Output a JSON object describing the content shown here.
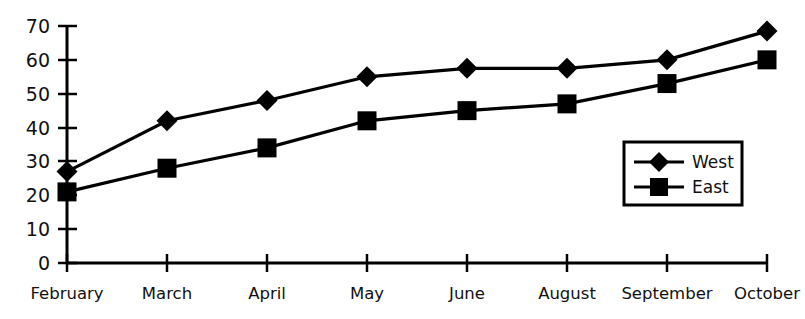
{
  "chart_data": {
    "type": "line",
    "title": "",
    "subtitle": "",
    "xlabel": "",
    "ylabel": "",
    "categories": [
      "February",
      "March",
      "April",
      "May",
      "June",
      "August",
      "September",
      "October"
    ],
    "series": [
      {
        "name": "West",
        "marker": "diamond",
        "color": "#000000",
        "values": [
          27,
          42,
          48,
          55,
          57.5,
          57.5,
          60,
          68.5
        ]
      },
      {
        "name": "East",
        "marker": "square",
        "color": "#000000",
        "values": [
          21,
          28,
          34,
          42,
          45,
          47,
          53,
          60
        ]
      }
    ],
    "ylim": [
      0,
      70
    ],
    "yticks": [
      0,
      10,
      20,
      30,
      40,
      50,
      60,
      70
    ],
    "ytick_labels": [
      "0",
      "10",
      "20",
      "30",
      "40",
      "50",
      "60",
      "70"
    ],
    "grid": false,
    "legend_position": "inside-right",
    "legend_entries": [
      {
        "label": "West",
        "marker": "diamond"
      },
      {
        "label": "East",
        "marker": "square"
      }
    ]
  },
  "colors": {
    "background": "#ffffff",
    "foreground": "#000000",
    "axis": "#000000",
    "text": "#111111"
  }
}
